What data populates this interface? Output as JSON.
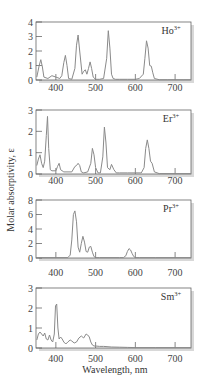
{
  "figure": {
    "ylabel": "Molar absorptivity, ε",
    "xlabel": "Wavelength, nm"
  },
  "chart_data": [
    {
      "type": "line",
      "title": "Ho3+",
      "ion": "Ho",
      "charge": "3+",
      "xlabel": "Wavelength, nm",
      "ylabel": "Molar absorptivity, ε",
      "xlim": [
        350,
        740
      ],
      "ylim": [
        0,
        4
      ],
      "xticks": [
        400,
        500,
        600,
        700
      ],
      "yticks": [
        0,
        1,
        2,
        3,
        4
      ],
      "x": [
        352,
        358,
        362,
        366,
        370,
        380,
        390,
        400,
        410,
        415,
        420,
        424,
        428,
        432,
        440,
        448,
        452,
        456,
        460,
        466,
        470,
        474,
        478,
        482,
        486,
        490,
        494,
        500,
        510,
        520,
        528,
        532,
        536,
        540,
        544,
        550,
        560,
        580,
        600,
        610,
        620,
        624,
        628,
        632,
        636,
        640,
        644,
        648,
        660,
        680,
        700,
        720,
        740
      ],
      "y": [
        0.2,
        1.0,
        1.4,
        0.9,
        0.2,
        0.1,
        0.3,
        0.2,
        0.1,
        0.3,
        1.2,
        1.7,
        1.0,
        0.1,
        0.05,
        0.8,
        2.4,
        3.1,
        2.0,
        0.4,
        0.6,
        0.7,
        0.4,
        0.8,
        1.25,
        0.8,
        0.2,
        0.05,
        0.05,
        0.1,
        1.5,
        3.4,
        2.2,
        0.4,
        0.1,
        0.05,
        0.05,
        0.05,
        0.05,
        0.1,
        0.4,
        1.5,
        2.7,
        2.2,
        1.0,
        0.95,
        0.5,
        0.1,
        0.02,
        0.02,
        0.02,
        0.02,
        0.02
      ]
    },
    {
      "type": "line",
      "title": "Er3+",
      "ion": "Er",
      "charge": "3+",
      "xlabel": "Wavelength, nm",
      "ylabel": "Molar absorptivity, ε",
      "xlim": [
        350,
        740
      ],
      "ylim": [
        0,
        3
      ],
      "xticks": [
        400,
        500,
        600,
        700
      ],
      "yticks": [
        0,
        1,
        2,
        3
      ],
      "x": [
        352,
        356,
        360,
        364,
        368,
        372,
        376,
        379,
        382,
        386,
        390,
        400,
        404,
        408,
        412,
        420,
        440,
        448,
        452,
        456,
        460,
        464,
        470,
        480,
        488,
        492,
        496,
        500,
        506,
        512,
        518,
        522,
        526,
        530,
        536,
        540,
        546,
        552,
        560,
        580,
        600,
        615,
        622,
        626,
        630,
        634,
        638,
        642,
        648,
        660,
        700,
        740
      ],
      "y": [
        0.4,
        0.7,
        0.9,
        0.5,
        0.3,
        0.6,
        1.8,
        2.7,
        1.2,
        0.2,
        0.15,
        0.15,
        0.35,
        0.5,
        0.2,
        0.1,
        0.1,
        0.35,
        0.4,
        0.5,
        0.4,
        0.1,
        0.05,
        0.1,
        0.5,
        1.2,
        0.9,
        0.3,
        0.05,
        0.05,
        0.8,
        2.2,
        1.5,
        0.3,
        0.2,
        0.45,
        0.2,
        0.05,
        0.05,
        0.05,
        0.05,
        0.05,
        0.3,
        1.2,
        1.6,
        1.2,
        0.6,
        0.5,
        0.1,
        0.02,
        0.02,
        0.02
      ]
    },
    {
      "type": "line",
      "title": "Pr3+",
      "ion": "Pr",
      "charge": "3+",
      "xlabel": "Wavelength, nm",
      "ylabel": "Molar absorptivity, ε",
      "xlim": [
        350,
        740
      ],
      "ylim": [
        0,
        8
      ],
      "xticks": [
        400,
        500,
        600,
        700
      ],
      "yticks": [
        0,
        2,
        4,
        6,
        8
      ],
      "x": [
        352,
        400,
        430,
        436,
        440,
        444,
        448,
        452,
        456,
        460,
        464,
        468,
        472,
        476,
        480,
        484,
        488,
        492,
        496,
        500,
        510,
        560,
        570,
        576,
        580,
        584,
        588,
        592,
        596,
        600,
        610,
        650,
        700,
        740
      ],
      "y": [
        0.05,
        0.05,
        0.05,
        0.4,
        2.5,
        6.0,
        6.5,
        5.0,
        1.5,
        0.8,
        2.0,
        3.0,
        2.2,
        0.9,
        0.8,
        1.5,
        1.6,
        0.8,
        0.2,
        0.05,
        0.05,
        0.05,
        0.05,
        0.3,
        0.9,
        1.3,
        1.1,
        0.6,
        0.2,
        0.05,
        0.05,
        0.05,
        0.05,
        0.05
      ]
    },
    {
      "type": "line",
      "title": "Sm3+",
      "ion": "Sm",
      "charge": "3+",
      "xlabel": "Wavelength, nm",
      "ylabel": "Molar absorptivity, ε",
      "xlim": [
        350,
        740
      ],
      "ylim": [
        0,
        3
      ],
      "xticks": [
        400,
        500,
        600,
        700
      ],
      "yticks": [
        0,
        1,
        2,
        3
      ],
      "x": [
        352,
        356,
        360,
        364,
        368,
        372,
        376,
        380,
        384,
        388,
        392,
        396,
        399,
        402,
        405,
        408,
        412,
        416,
        420,
        425,
        430,
        436,
        440,
        446,
        452,
        458,
        464,
        470,
        476,
        480,
        484,
        488,
        492,
        496,
        500,
        510,
        520,
        540,
        560,
        580,
        600,
        650,
        700,
        740
      ],
      "y": [
        0.4,
        0.7,
        0.8,
        0.7,
        0.6,
        0.75,
        0.45,
        0.4,
        0.65,
        0.4,
        0.3,
        0.7,
        2.1,
        2.2,
        1.0,
        0.45,
        0.55,
        0.45,
        0.3,
        0.2,
        0.3,
        0.4,
        0.35,
        0.25,
        0.3,
        0.5,
        0.6,
        0.5,
        0.7,
        0.65,
        0.55,
        0.3,
        0.15,
        0.1,
        0.1,
        0.08,
        0.08,
        0.05,
        0.04,
        0.03,
        0.02,
        0.02,
        0.02,
        0.02
      ]
    }
  ]
}
